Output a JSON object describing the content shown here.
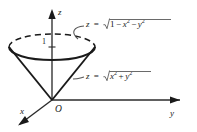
{
  "figure": {
    "title_alt": "cone and hemisphere solid region diagram",
    "colors": {
      "ink": "#1a1a1a",
      "axis": "#3a3a3a",
      "leader": "#555555",
      "radical_rule": "#6a6a6a",
      "background": "#ffffff"
    },
    "axes": [
      {
        "name": "z-axis",
        "label": "z",
        "direction": "up",
        "arrow": true
      },
      {
        "name": "y-axis",
        "label": "y",
        "direction": "right",
        "arrow": true
      },
      {
        "name": "x-axis",
        "label": "x",
        "direction": "down-left",
        "arrow": true
      }
    ],
    "origin": {
      "label": "O"
    },
    "ticks": [
      {
        "axis": "z",
        "label": "1",
        "value": 1
      }
    ],
    "surfaces": [
      {
        "name": "hemisphere",
        "equation_text": "z = √(1 − x² − y²)",
        "lhs": "z",
        "equals": "=",
        "radicand_terms": [
          "1",
          "−",
          "x",
          "2",
          "−",
          "y",
          "2"
        ]
      },
      {
        "name": "cone",
        "equation_text": "z = √(x² + y²)",
        "lhs": "z",
        "equals": "=",
        "radicand_terms": [
          "x",
          "2",
          "+",
          "y",
          "2"
        ]
      }
    ],
    "formula_upper": {
      "lhs": "z",
      "equals": "=",
      "one": "1",
      "minus_1": "−",
      "x": "x",
      "x_exp": "2",
      "minus_2": "−",
      "y": "y",
      "y_exp": "2"
    },
    "formula_lower": {
      "lhs": "z",
      "equals": "=",
      "x": "x",
      "x_exp": "2",
      "plus": "+",
      "y": "y",
      "y_exp": "2"
    }
  }
}
